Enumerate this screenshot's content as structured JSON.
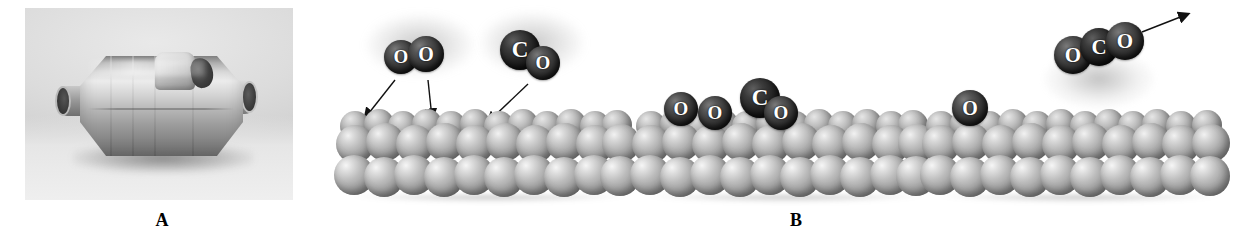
{
  "figure": {
    "panels": [
      {
        "id": "A",
        "label": "A",
        "kind": "photograph",
        "subject": "catalytic-converter"
      },
      {
        "id": "B",
        "label": "B",
        "kind": "mechanism-diagram",
        "subject": "catalytic-oxidation-of-CO-on-metal-surface"
      }
    ]
  },
  "panel_a": {
    "label": "A",
    "caption": "",
    "photo_alt": "catalytic converter"
  },
  "panel_b": {
    "label": "B",
    "stages": [
      {
        "name": "adsorption",
        "molecules": [
          {
            "name": "oxygen-molecule",
            "formula": "O2",
            "atoms": [
              "O",
              "O"
            ]
          },
          {
            "name": "carbon-monoxide-molecule",
            "formula": "CO",
            "atoms": [
              "C",
              "O"
            ]
          }
        ],
        "arrows": 3,
        "arrow_direction": "down-to-surface"
      },
      {
        "name": "dissociation-and-surface-reaction",
        "molecules": [
          {
            "name": "adsorbed-oxygen-atom",
            "formula": "O",
            "atoms": [
              "O"
            ]
          },
          {
            "name": "adsorbed-oxygen-atom",
            "formula": "O",
            "atoms": [
              "O"
            ]
          },
          {
            "name": "adsorbed-carbon-monoxide",
            "formula": "CO",
            "atoms": [
              "C",
              "O"
            ]
          }
        ],
        "arrows": 0,
        "arrow_direction": ""
      },
      {
        "name": "desorption",
        "molecules": [
          {
            "name": "carbon-dioxide-molecule",
            "formula": "CO2",
            "atoms": [
              "O",
              "C",
              "O"
            ]
          },
          {
            "name": "adsorbed-oxygen-atom",
            "formula": "O",
            "atoms": [
              "O"
            ]
          }
        ],
        "arrows": 1,
        "arrow_direction": "up-and-right-away-from-surface"
      }
    ]
  },
  "atom_labels": {
    "oxygen": "O",
    "carbon": "C"
  },
  "colors": {
    "background": "#ffffff",
    "atom_dark": "#262626",
    "atom_carbon": "#141414",
    "metal_sphere_light": "#f2f2f2",
    "metal_sphere_mid": "#b9b9b9",
    "metal_sphere_dark": "#6a6a6a",
    "arrow": "#111111",
    "label_text": "#000000",
    "photo_background": "#d7d7d7"
  }
}
